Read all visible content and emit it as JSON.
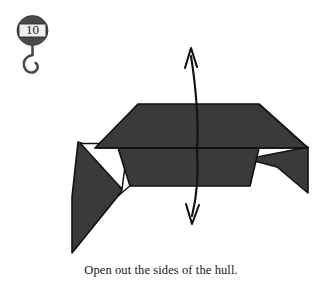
{
  "page": {
    "width": 322,
    "height": 291,
    "background": "#ffffff"
  },
  "step_badge": {
    "number": "10",
    "shape": "oval-with-hook",
    "oval_fill": "#4a4a4a",
    "label_box_fill": "#f2f0ea",
    "hook_color": "#4a4a4a",
    "icon_name": "step-marker-hook"
  },
  "caption": {
    "text": "Open out the sides of the hull."
  },
  "diagram": {
    "paper_fill": "#3a3a3a",
    "paper_stroke": "#111111",
    "reverse_fill": "#ffffff",
    "arrow_color": "#111111",
    "arrow_label": "open-out-both-directions",
    "shapes": [
      {
        "name": "top-deck-panel",
        "points": "95,148 138,104 259,104 308,148",
        "fill": "#3a3a3a"
      },
      {
        "name": "lower-hull-body",
        "points": "118,148 259,148 250,186 130,186",
        "fill": "#3a3a3a"
      },
      {
        "name": "left-outer-flap",
        "points": "78,142 95,148 122,190 118,196 72,253 72,196",
        "fill": "#3a3a3a"
      },
      {
        "name": "left-white-reverse-triangle",
        "points": "80,143 128,143 122,189",
        "fill": "#ffffff"
      },
      {
        "name": "right-outer-flap",
        "points": "248,160 308,148 308,192 278,168",
        "fill": "#3a3a3a"
      }
    ],
    "fold_lines": [
      {
        "name": "deck-lower-crease",
        "from": "95,148",
        "to": "308,148"
      },
      {
        "name": "left-flap-crease",
        "from": "118,196",
        "to": "130,186"
      }
    ],
    "arrows": [
      {
        "name": "open-arrow-up",
        "direction": "up",
        "tip": "191,48",
        "tail": "197,150"
      },
      {
        "name": "open-arrow-down",
        "direction": "down",
        "tip": "192,224",
        "tail": "197,150"
      }
    ]
  }
}
